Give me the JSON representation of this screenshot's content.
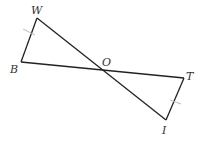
{
  "diagram": {
    "type": "geometry",
    "points": {
      "W": {
        "label": "W",
        "x": 37,
        "y": 18
      },
      "B": {
        "label": "B",
        "x": 21,
        "y": 62
      },
      "O": {
        "label": "O",
        "x": 101,
        "y": 69
      },
      "T": {
        "label": "T",
        "x": 184,
        "y": 78
      },
      "I": {
        "label": "I",
        "x": 166,
        "y": 120
      }
    },
    "segments": [
      [
        "W",
        "I"
      ],
      [
        "B",
        "T"
      ],
      [
        "W",
        "B"
      ],
      [
        "T",
        "I"
      ]
    ],
    "congruence_marks": [
      {
        "segment": [
          "W",
          "B"
        ],
        "ticks": 1
      },
      {
        "segment": [
          "T",
          "I"
        ],
        "ticks": 1
      }
    ],
    "colors": {
      "line": "#222222",
      "tick": "#bbbbbb",
      "label": "#333333"
    }
  }
}
